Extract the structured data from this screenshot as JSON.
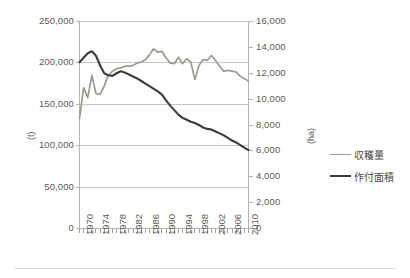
{
  "chart_data": {
    "type": "line",
    "title": "",
    "xlabel": "",
    "ylabel": "(t)",
    "y2label": "(ha)",
    "grid": true,
    "legend_position": "right",
    "xlim": [
      1970,
      2011
    ],
    "ylim": [
      0,
      250000
    ],
    "y2lim": [
      0,
      16000
    ],
    "y_ticks": [
      "0",
      "50,000",
      "100,000",
      "150,000",
      "200,000",
      "250,000"
    ],
    "y_tick_values": [
      0,
      50000,
      100000,
      150000,
      200000,
      250000
    ],
    "y2_ticks": [
      "0",
      "2,000",
      "4,000",
      "6,000",
      "8,000",
      "10,000",
      "12,000",
      "14,000",
      "16,000"
    ],
    "y2_tick_values": [
      0,
      2000,
      4000,
      6000,
      8000,
      10000,
      12000,
      14000,
      16000
    ],
    "x_ticks": [
      "1970",
      "1974",
      "1978",
      "1982",
      "1986",
      "1990",
      "1994",
      "1998",
      "2002",
      "2006",
      "2010"
    ],
    "x_tick_values": [
      1970,
      1974,
      1978,
      1982,
      1986,
      1990,
      1994,
      1998,
      2002,
      2006,
      2010
    ],
    "x": [
      1970,
      1971,
      1972,
      1973,
      1974,
      1975,
      1976,
      1977,
      1978,
      1979,
      1980,
      1981,
      1982,
      1983,
      1984,
      1985,
      1986,
      1987,
      1988,
      1989,
      1990,
      1991,
      1992,
      1993,
      1994,
      1995,
      1996,
      1997,
      1998,
      1999,
      2000,
      2001,
      2002,
      2003,
      2004,
      2005,
      2006,
      2007,
      2008,
      2009,
      2010,
      2011
    ],
    "series": [
      {
        "name": "収穫量",
        "axis": "left",
        "unit": "t",
        "color": "#9a9a8e",
        "values": [
          133000,
          170000,
          158000,
          185000,
          163000,
          162000,
          172000,
          185000,
          190000,
          193000,
          194000,
          196000,
          196000,
          197000,
          200000,
          201000,
          204000,
          210000,
          217000,
          213000,
          214000,
          206000,
          200000,
          199000,
          207000,
          199000,
          205000,
          201000,
          180000,
          197000,
          204000,
          203000,
          209000,
          203000,
          196000,
          190000,
          191000,
          190000,
          189000,
          184000,
          181000,
          178000
        ]
      },
      {
        "name": "作付面積",
        "axis": "right",
        "unit": "ha",
        "color": "#3f3a35",
        "values": [
          12850,
          13200,
          13550,
          13700,
          13350,
          12600,
          12000,
          11850,
          11800,
          12000,
          12150,
          12050,
          11900,
          11750,
          11600,
          11400,
          11200,
          11000,
          10800,
          10600,
          10350,
          9900,
          9500,
          9150,
          8800,
          8550,
          8400,
          8250,
          8150,
          8000,
          7800,
          7700,
          7650,
          7500,
          7350,
          7200,
          7000,
          6800,
          6650,
          6450,
          6250,
          6050
        ]
      }
    ]
  }
}
